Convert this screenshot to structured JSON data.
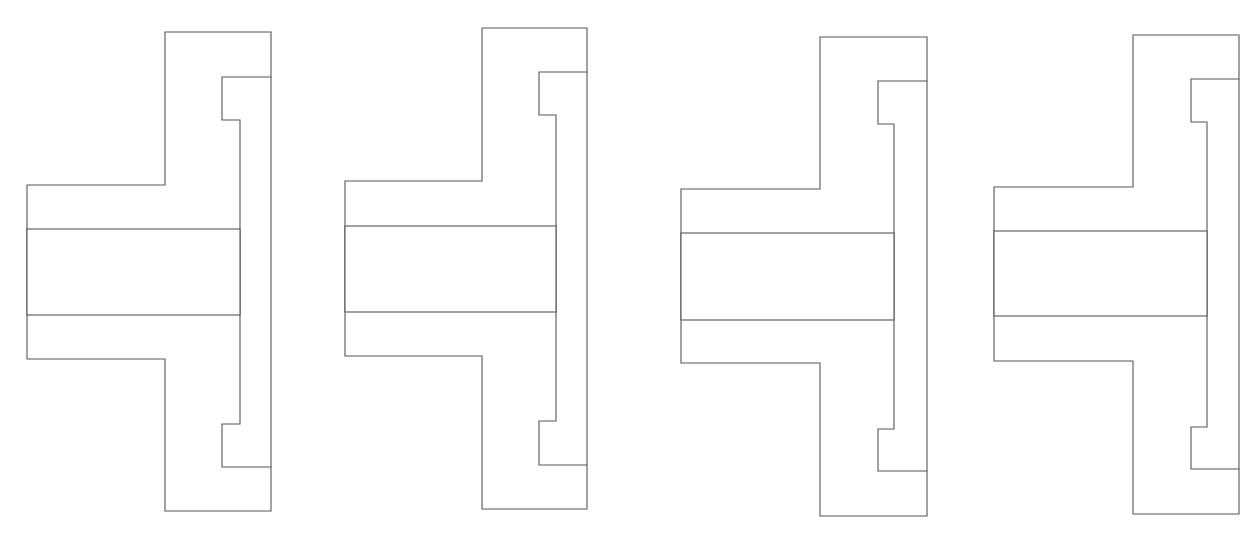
{
  "caption": {
    "text": "",
    "note": "clipped text line at top edge (only descenders visible)"
  },
  "colors": {
    "line": "#555555",
    "background": "#ffffff"
  },
  "figures": [
    {
      "id": "fig-1",
      "hatch": "diagonal-45",
      "label": ""
    },
    {
      "id": "fig-2",
      "hatch": "diagonal-45-dashed-alternating",
      "label": ""
    },
    {
      "id": "fig-3",
      "hatch": "diagonal-45-grouped",
      "label": ""
    },
    {
      "id": "fig-4",
      "hatch": "cross-hatch",
      "label": ""
    }
  ]
}
